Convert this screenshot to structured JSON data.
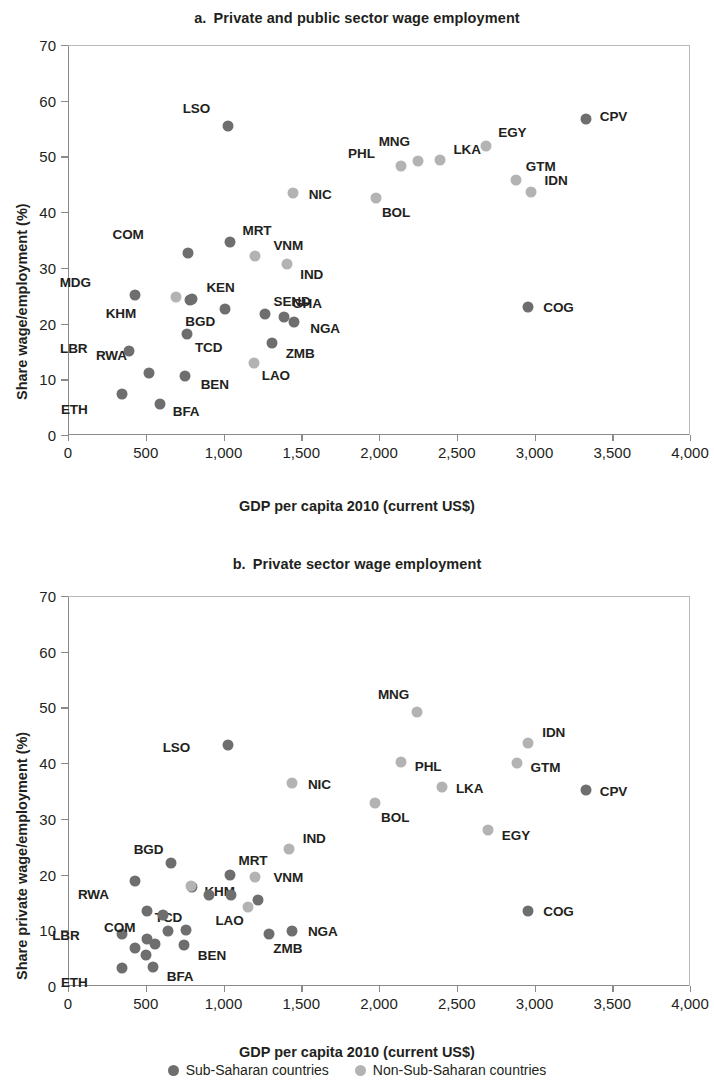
{
  "legend": {
    "items": [
      {
        "label": "Sub-Saharan countries",
        "key": "ssa",
        "color": "#6e6e6e"
      },
      {
        "label": "Non-Sub-Saharan countries",
        "key": "nssa",
        "color": "#b3b3b3"
      }
    ]
  },
  "panel_a": {
    "letter": "a.",
    "title": "Private and public sector wage employment",
    "xlabel": "GDP per capita 2010 (current US$)",
    "ylabel": "Share wage/employment (%)"
  },
  "panel_b": {
    "letter": "b.",
    "title": "Private sector wage employment",
    "xlabel": "GDP per capita 2010 (current US$)",
    "ylabel": "Share private wage/employment (%)"
  },
  "chart_data": [
    {
      "id": "panel_a",
      "type": "scatter",
      "title": "a. Private and public sector wage employment",
      "xlabel": "GDP per capita 2010 (current US$)",
      "ylabel": "Share wage/employment (%)",
      "xlim": [
        0,
        4000
      ],
      "ylim": [
        0,
        70
      ],
      "xticks": [
        0,
        500,
        1000,
        1500,
        2000,
        2500,
        3000,
        3500,
        4000
      ],
      "xticklabels": [
        "0",
        "500",
        "1,000",
        "1,500",
        "2,000",
        "2,500",
        "3,000",
        "3,500",
        "4,000"
      ],
      "yticks": [
        0,
        10,
        20,
        30,
        40,
        50,
        60,
        70
      ],
      "yticklabels": [
        "0",
        "10",
        "20",
        "30",
        "40",
        "50",
        "60",
        "70"
      ],
      "grid": false,
      "legend_position": "below-figure",
      "series": [
        {
          "name": "Sub-Saharan countries",
          "color": "#6e6e6e",
          "points": [
            {
              "label": "ETH",
              "x": 345,
              "y": 7.3,
              "lx": -34,
              "ly": 16
            },
            {
              "label": "LBR",
              "x": 395,
              "y": 15.1,
              "lx": -42,
              "ly": -2
            },
            {
              "label": "RWA",
              "x": 520,
              "y": 11.2,
              "lx": -22,
              "ly": -17
            },
            {
              "label": "BFA",
              "x": 590,
              "y": 5.6,
              "lx": 13,
              "ly": 8
            },
            {
              "label": "MDG",
              "x": 430,
              "y": 25.2,
              "lx": -44,
              "ly": -12
            },
            {
              "label": "COM",
              "x": 770,
              "y": 32.6,
              "lx": -44,
              "ly": -18
            },
            {
              "label": "KHM",
              "x": 785,
              "y": 24.2,
              "lx": -54,
              "ly": 14
            },
            {
              "label": "TCD",
              "x": 765,
              "y": 18.2,
              "lx": 8,
              "ly": 14
            },
            {
              "label": "KEN",
              "x": 800,
              "y": 24.5,
              "lx": 14,
              "ly": -11
            },
            {
              "label": "BEN",
              "x": 750,
              "y": 10.6,
              "lx": 16,
              "ly": 9
            },
            {
              "label": "LSO",
              "x": 1030,
              "y": 55.4,
              "lx": -18,
              "ly": -17
            },
            {
              "label": "BGD",
              "x": 1010,
              "y": 22.6,
              "lx": -10,
              "ly": 13
            },
            {
              "label": "MRT",
              "x": 1045,
              "y": 34.6,
              "lx": 12,
              "ly": -11
            },
            {
              "label": "SEND",
              "x": 1270,
              "y": 21.8,
              "lx": 8,
              "ly": -12
            },
            {
              "label": "ZMB",
              "x": 1310,
              "y": 16.6,
              "lx": 14,
              "ly": 11
            },
            {
              "label": "GHA",
              "x": 1390,
              "y": 21.2,
              "lx": 8,
              "ly": -13
            },
            {
              "label": "NGA",
              "x": 1455,
              "y": 20.3,
              "lx": 16,
              "ly": 7
            },
            {
              "label": "CPV",
              "x": 3330,
              "y": 56.8,
              "lx": 14,
              "ly": -2
            },
            {
              "label": "COG",
              "x": 2960,
              "y": 22.9,
              "lx": 15,
              "ly": 1
            }
          ]
        },
        {
          "name": "Non-Sub-Saharan countries",
          "color": "#b3b3b3",
          "points": [
            {
              "label": "",
              "x": 695,
              "y": 24.8,
              "lx": 0,
              "ly": 0
            },
            {
              "label": "LAO",
              "x": 1195,
              "y": 13.0,
              "lx": 8,
              "ly": 13
            },
            {
              "label": "VNM",
              "x": 1205,
              "y": 32.2,
              "lx": 18,
              "ly": -10
            },
            {
              "label": "IND",
              "x": 1410,
              "y": 30.7,
              "lx": 13,
              "ly": 11
            },
            {
              "label": "NIC",
              "x": 1445,
              "y": 43.5,
              "lx": 16,
              "ly": 2
            },
            {
              "label": "BOL",
              "x": 1980,
              "y": 42.5,
              "lx": 6,
              "ly": 15
            },
            {
              "label": "PHL",
              "x": 2140,
              "y": 48.3,
              "lx": -26,
              "ly": -12
            },
            {
              "label": "MNG",
              "x": 2250,
              "y": 49.2,
              "lx": -8,
              "ly": -19
            },
            {
              "label": "LKA",
              "x": 2395,
              "y": 49.4,
              "lx": 13,
              "ly": -10
            },
            {
              "label": "EGY",
              "x": 2690,
              "y": 51.8,
              "lx": 12,
              "ly": -13
            },
            {
              "label": "GTM",
              "x": 2880,
              "y": 45.8,
              "lx": 10,
              "ly": -13
            },
            {
              "label": "IDN",
              "x": 2975,
              "y": 43.7,
              "lx": 14,
              "ly": -11
            }
          ]
        }
      ]
    },
    {
      "id": "panel_b",
      "type": "scatter",
      "title": "b. Private sector wage employment",
      "xlabel": "GDP per capita 2010 (current US$)",
      "ylabel": "Share private wage/employment (%)",
      "xlim": [
        0,
        4000
      ],
      "ylim": [
        0,
        70
      ],
      "xticks": [
        0,
        500,
        1000,
        1500,
        2000,
        2500,
        3000,
        3500,
        4000
      ],
      "xticklabels": [
        "0",
        "500",
        "1,000",
        "1,500",
        "2,000",
        "2,500",
        "3,000",
        "3,500",
        "4,000"
      ],
      "yticks": [
        0,
        10,
        20,
        30,
        40,
        50,
        60,
        70
      ],
      "yticklabels": [
        "0",
        "10",
        "20",
        "30",
        "40",
        "50",
        "60",
        "70"
      ],
      "grid": false,
      "legend_position": "below-figure",
      "series": [
        {
          "name": "Sub-Saharan countries",
          "color": "#6e6e6e",
          "points": [
            {
              "label": "ETH",
              "x": 345,
              "y": 3.3,
              "lx": -34,
              "ly": 15
            },
            {
              "label": "LBR",
              "x": 345,
              "y": 9.4,
              "lx": -42,
              "ly": 2
            },
            {
              "label": "RWA",
              "x": 430,
              "y": 18.8,
              "lx": -26,
              "ly": 14
            },
            {
              "label": "COM",
              "x": 510,
              "y": 13.4,
              "lx": -12,
              "ly": 17
            },
            {
              "label": "BFA",
              "x": 545,
              "y": 3.5,
              "lx": 14,
              "ly": 10
            },
            {
              "label": "TCD",
              "x": 760,
              "y": 10.0,
              "lx": -4,
              "ly": -12
            },
            {
              "label": "BEN",
              "x": 745,
              "y": 7.3,
              "lx": 14,
              "ly": 11
            },
            {
              "label": "KHM",
              "x": 800,
              "y": 17.8,
              "lx": 12,
              "ly": 5
            },
            {
              "label": "BGD",
              "x": 665,
              "y": 22.0,
              "lx": -8,
              "ly": -13
            },
            {
              "label": "MRT",
              "x": 1045,
              "y": 19.9,
              "lx": 8,
              "ly": -14
            },
            {
              "label": "LSO",
              "x": 1030,
              "y": 43.2,
              "lx": -38,
              "ly": 3
            },
            {
              "label": "ZMB",
              "x": 1295,
              "y": 9.3,
              "lx": 4,
              "ly": 15
            },
            {
              "label": "NGA",
              "x": 1440,
              "y": 9.8,
              "lx": 16,
              "ly": 1
            },
            {
              "label": "CPV",
              "x": 3330,
              "y": 35.2,
              "lx": 14,
              "ly": 2
            },
            {
              "label": "COG",
              "x": 2960,
              "y": 13.4,
              "lx": 15,
              "ly": 1
            },
            {
              "label": "SEN",
              "x": 1050,
              "y": 16.4,
              "lx": 0,
              "ly": 0
            },
            {
              "label": "GHA",
              "x": 1225,
              "y": 15.5,
              "lx": 0,
              "ly": 0
            },
            {
              "label": "KEN",
              "x": 905,
              "y": 16.3,
              "lx": 0,
              "ly": 0
            },
            {
              "label": "MDG",
              "x": 560,
              "y": 7.5,
              "lx": 0,
              "ly": 0
            },
            {
              "label": "BDI",
              "x": 505,
              "y": 8.4,
              "lx": 0,
              "ly": 0
            },
            {
              "label": "MWI",
              "x": 610,
              "y": 12.7,
              "lx": 0,
              "ly": 0
            },
            {
              "label": "TZA",
              "x": 645,
              "y": 9.9,
              "lx": 0,
              "ly": 0
            },
            {
              "label": "UGA",
              "x": 430,
              "y": 6.8,
              "lx": 0,
              "ly": 0
            },
            {
              "label": "MLI",
              "x": 500,
              "y": 5.6,
              "lx": 0,
              "ly": 0
            }
          ]
        },
        {
          "name": "Non-Sub-Saharan countries",
          "color": "#b3b3b3",
          "points": [
            {
              "label": "LAO",
              "x": 1155,
              "y": 14.2,
              "lx": -4,
              "ly": 14
            },
            {
              "label": "VNM",
              "x": 1205,
              "y": 19.5,
              "lx": 18,
              "ly": 1
            },
            {
              "label": "IND",
              "x": 1420,
              "y": 24.6,
              "lx": 14,
              "ly": -10
            },
            {
              "label": "NIC",
              "x": 1440,
              "y": 36.5,
              "lx": 16,
              "ly": 2
            },
            {
              "label": "BOL",
              "x": 1975,
              "y": 32.9,
              "lx": 6,
              "ly": 15
            },
            {
              "label": "PHL",
              "x": 2140,
              "y": 40.2,
              "lx": 14,
              "ly": 5
            },
            {
              "label": "MNG",
              "x": 2245,
              "y": 49.1,
              "lx": -8,
              "ly": -17
            },
            {
              "label": "LKA",
              "x": 2405,
              "y": 35.7,
              "lx": 14,
              "ly": 2
            },
            {
              "label": "EGY",
              "x": 2700,
              "y": 28.0,
              "lx": 14,
              "ly": 6
            },
            {
              "label": "GTM",
              "x": 2885,
              "y": 40.0,
              "lx": 14,
              "ly": 5
            },
            {
              "label": "IDN",
              "x": 2960,
              "y": 43.6,
              "lx": 14,
              "ly": -10
            },
            {
              "label": "KGZ",
              "x": 790,
              "y": 17.9,
              "lx": 0,
              "ly": 0
            }
          ]
        }
      ]
    }
  ]
}
